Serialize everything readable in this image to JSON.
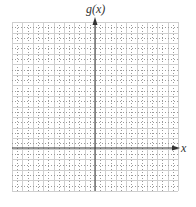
{
  "graph": {
    "y_axis_label": "g(x)",
    "x_axis_label": "x",
    "grid": {
      "columns": 16,
      "rows": 16,
      "y_axis_column": 8,
      "x_axis_row": 12,
      "minor_dotted": true
    },
    "colors": {
      "grid_solid": "#cfcfcf",
      "grid_dotted": "#9a9a9a",
      "axis": "#333333"
    }
  }
}
